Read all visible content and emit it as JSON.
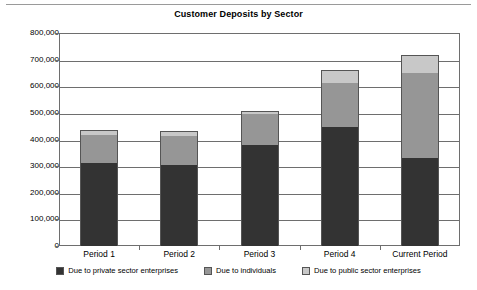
{
  "chart_data": {
    "type": "bar",
    "subtype": "stacked-column",
    "title": "Customer Deposits by Sector",
    "xlabel": "",
    "ylabel": "",
    "ylim": [
      0,
      800000
    ],
    "ytick_step": 100000,
    "ytick_labels": [
      "800,000",
      "700,000",
      "600,000",
      "500,000",
      "400,000",
      "300,000",
      "200,000",
      "100,000",
      "0"
    ],
    "ytick_values": [
      800000,
      700000,
      600000,
      500000,
      400000,
      300000,
      200000,
      100000,
      0
    ],
    "grid": true,
    "legend_position": "bottom",
    "categories": [
      "Period 1",
      "Period 2",
      "Period 3",
      "Period 4",
      "Current Period"
    ],
    "series": [
      {
        "name": "Due to private sector enterprises",
        "color": "#333333",
        "swatch": "dark",
        "values": [
          312000,
          305000,
          380000,
          447000,
          331000
        ]
      },
      {
        "name": "Due to individuals",
        "color": "#969696",
        "swatch": "medium",
        "values": [
          105000,
          109000,
          117000,
          165000,
          320000
        ]
      },
      {
        "name": "Due to public sector enterprises",
        "color": "#c8c8c8",
        "swatch": "light",
        "values": [
          19000,
          19000,
          11000,
          49000,
          68000
        ]
      }
    ],
    "totals": [
      436000,
      433000,
      508000,
      661000,
      719000
    ]
  },
  "colors": {
    "dark": "#333333",
    "medium": "#969696",
    "light": "#c8c8c8",
    "axis": "#6e6e6e",
    "text": "#000000",
    "background": "#ffffff"
  }
}
